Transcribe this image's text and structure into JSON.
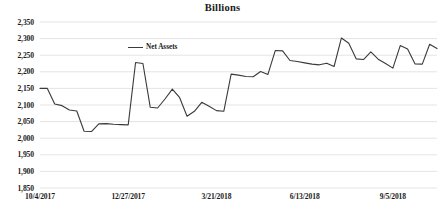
{
  "chart_data": {
    "type": "line",
    "title": "Billions",
    "xlabel": "",
    "ylabel": "",
    "ylim": [
      1850,
      2350
    ],
    "ytick_step": 50,
    "ytick_labels": [
      "2,350",
      "2,300",
      "2,250",
      "2,200",
      "2,150",
      "2,100",
      "2,050",
      "2,000",
      "1,950",
      "1,900",
      "1,850"
    ],
    "ytick_values": [
      2350,
      2300,
      2250,
      2200,
      2150,
      2100,
      2050,
      2000,
      1950,
      1900,
      1850
    ],
    "xtick_labels": [
      "10/4/2017",
      "12/27/2017",
      "3/21/2018",
      "6/13/2018",
      "9/5/2018"
    ],
    "xtick_indices": [
      0,
      12,
      24,
      36,
      48
    ],
    "grid": true,
    "legend_position": "inside-top-left",
    "line_color": "#3a3a3a",
    "grid_color": "#d9d9d9",
    "series": [
      {
        "name": "Net Assets",
        "values": [
          2150,
          2150,
          2103,
          2098,
          2085,
          2082,
          2021,
          2020,
          2043,
          2044,
          2042,
          2041,
          2040,
          2228,
          2225,
          2093,
          2091,
          2118,
          2148,
          2122,
          2066,
          2081,
          2108,
          2096,
          2083,
          2081,
          2193,
          2190,
          2186,
          2185,
          2201,
          2192,
          2264,
          2263,
          2234,
          2231,
          2227,
          2223,
          2221,
          2226,
          2216,
          2302,
          2286,
          2239,
          2237,
          2260,
          2238,
          2225,
          2211,
          2279,
          2269,
          2224,
          2223,
          2283,
          2270
        ]
      }
    ]
  },
  "legend": {
    "label": "Net Assets"
  }
}
